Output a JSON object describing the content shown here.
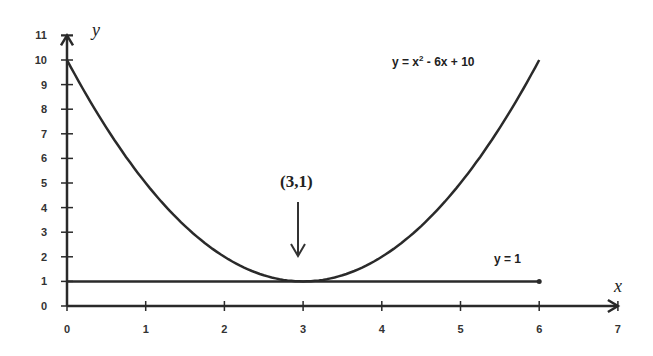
{
  "chart_data": {
    "type": "line",
    "title": "",
    "xlabel": "x",
    "ylabel": "y",
    "xlim": [
      0,
      7
    ],
    "ylim": [
      0,
      11
    ],
    "x_ticks": [
      "0",
      "1",
      "2",
      "3",
      "4",
      "5",
      "6",
      "7"
    ],
    "y_ticks": [
      "0",
      "1",
      "2",
      "3",
      "4",
      "5",
      "6",
      "7",
      "8",
      "9",
      "10",
      "11"
    ],
    "grid": false,
    "series": [
      {
        "name": "y = x² - 6x + 10",
        "x": [
          0,
          0.5,
          1,
          1.5,
          2,
          2.5,
          3,
          3.5,
          4,
          4.5,
          5,
          5.5,
          6
        ],
        "values": [
          10,
          7.25,
          5,
          3.25,
          2,
          1.25,
          1,
          1.25,
          2,
          3.25,
          5,
          7.25,
          10
        ]
      },
      {
        "name": "y = 1",
        "x": [
          0,
          6
        ],
        "values": [
          1,
          1
        ]
      }
    ],
    "annotations": [
      {
        "text": "(3,1)",
        "x": 3,
        "y": 1,
        "arrow": "down"
      },
      {
        "text": "y = x² - 6x + 10",
        "position": "top-right"
      },
      {
        "text": "y = 1",
        "position": "right, above line y=1"
      }
    ]
  },
  "labels": {
    "x_axis": "x",
    "y_axis": "y",
    "parabola": "y = x",
    "parabola_sup": "2",
    "parabola_rest": " - 6x + 10",
    "line": "y = 1",
    "vertex": "(3,1)"
  },
  "ticks": {
    "x": [
      "0",
      "1",
      "2",
      "3",
      "4",
      "5",
      "6",
      "7"
    ],
    "y": [
      "0",
      "1",
      "2",
      "3",
      "4",
      "5",
      "6",
      "7",
      "8",
      "9",
      "10",
      "11"
    ]
  }
}
